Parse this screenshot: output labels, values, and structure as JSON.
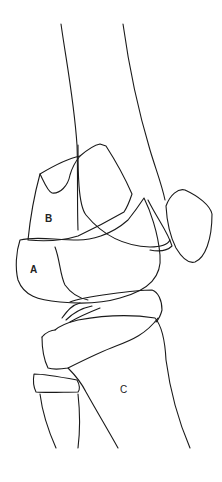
{
  "figure": {
    "labels": {
      "a": "A",
      "b": "B",
      "c": "C"
    },
    "stroke_color": "#1a1a1a",
    "background": "#ffffff"
  }
}
